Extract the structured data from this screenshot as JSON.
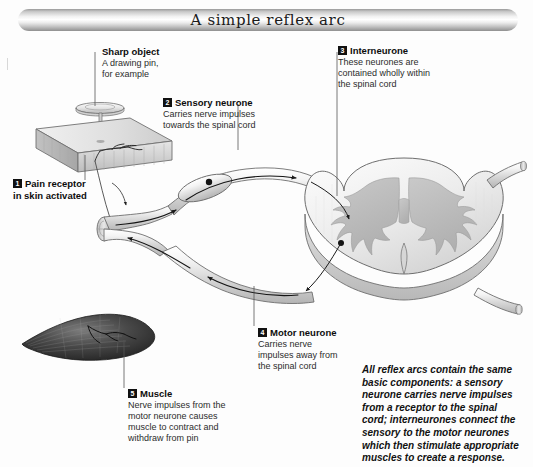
{
  "banner": {
    "title": "A simple reflex arc"
  },
  "notes": {
    "sharp_object": {
      "heading": "Sharp object",
      "lines": [
        "A drawing pin,",
        "for example"
      ]
    },
    "sensory_neurone": {
      "number": "2",
      "heading": "Sensory neurone",
      "lines": [
        "Carries nerve impulses",
        "towards the spinal cord"
      ]
    },
    "interneurone": {
      "number": "3",
      "heading": "Interneurone",
      "lines": [
        "These neurones are",
        "contained wholly within",
        "the spinal cord"
      ]
    },
    "pain_receptor": {
      "number": "1",
      "heading": "Pain receptor",
      "lines": [
        "in skin activated"
      ]
    },
    "motor_neurone": {
      "number": "4",
      "heading": "Motor neurone",
      "lines": [
        "Carries nerve",
        "impulses away from",
        "the spinal cord"
      ]
    },
    "muscle": {
      "number": "5",
      "heading": "Muscle",
      "lines": [
        "Nerve impulses from the",
        "motor neurone causes",
        "muscle to contract and",
        "withdraw from pin"
      ]
    }
  },
  "summary": {
    "lines": [
      "All reflex arcs contain the same",
      "basic components: a sensory",
      "neurone carries nerve impulses",
      "from a receptor to the spinal",
      "cord; interneurones connect the",
      "sensory to the motor neurones",
      "which then stimulate appropriate",
      "muscles to create a response."
    ]
  },
  "colors": {
    "ink": "#111111",
    "body_text": "#2c2c2c",
    "nerve_fill": "#e8e8e8",
    "nerve_stroke": "#7a7a7a",
    "cord_fill": "#f0f0f0",
    "grey_matter": "#c4c4c4",
    "muscle_dark": "#2b2b2b",
    "skin_fill": "#dcdcdc"
  },
  "figure": {
    "parts": [
      "drawing-pin",
      "skin-block",
      "pain-receptor-nerve-endings",
      "peripheral-nerve-cut-end",
      "sensory-neurone-fibre",
      "dorsal-root-ganglion",
      "spinal-cord-cross-section",
      "grey-matter-butterfly",
      "interneurone-path",
      "motor-neurone-fibre",
      "muscle"
    ]
  }
}
